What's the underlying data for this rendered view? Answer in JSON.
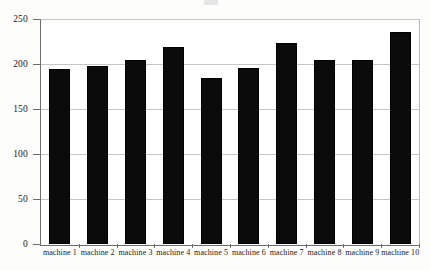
{
  "chart_data": {
    "type": "bar",
    "title": "",
    "xlabel": "",
    "ylabel": "",
    "categories": [
      "machine 1",
      "machine 2",
      "machine 3",
      "machine 4",
      "machine 5",
      "machine 6",
      "machine 7",
      "machine 8",
      "machine 9",
      "machine 10"
    ],
    "values": [
      195,
      198,
      205,
      219,
      185,
      196,
      223,
      205,
      205,
      236
    ],
    "ylim": [
      0,
      250
    ],
    "ytick_labels": [
      "0",
      "50",
      "100",
      "150",
      "200",
      "250"
    ],
    "ytick_values": [
      0,
      50,
      100,
      150,
      200,
      250
    ],
    "grid": "horizontal",
    "legend": "none",
    "bar_color": "#0b0b0b",
    "gridline_color": "#c6c6c6",
    "axis_color": "#6e6e6e",
    "background_color": "#ffffff"
  },
  "figure": {
    "caption": ""
  }
}
